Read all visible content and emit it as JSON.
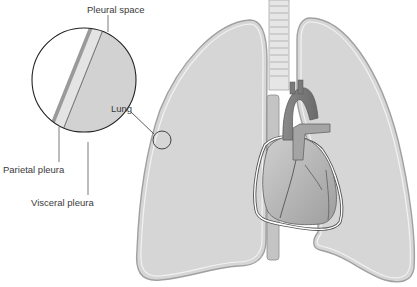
{
  "diagram": {
    "labels": {
      "pleural_space": "Pleural space",
      "lung": "Lung",
      "parietal_pleura": "Parietal pleura",
      "visceral_pleura": "Visceral pleura"
    },
    "colors": {
      "lung_fill": "#d8d8d8",
      "pleura_outline": "#9a9a9a",
      "pleural_space_fill": "#e8e8e8",
      "parietal_stripe": "#a8a8a8",
      "heart_fill": "#b9b9b9",
      "vessel_dark": "#7c7c7c",
      "trachea": "#e4e4e4"
    },
    "structures": [
      "Left lung",
      "Right lung",
      "Trachea",
      "Heart",
      "Aorta",
      "Pulmonary artery",
      "Esophagus"
    ]
  }
}
